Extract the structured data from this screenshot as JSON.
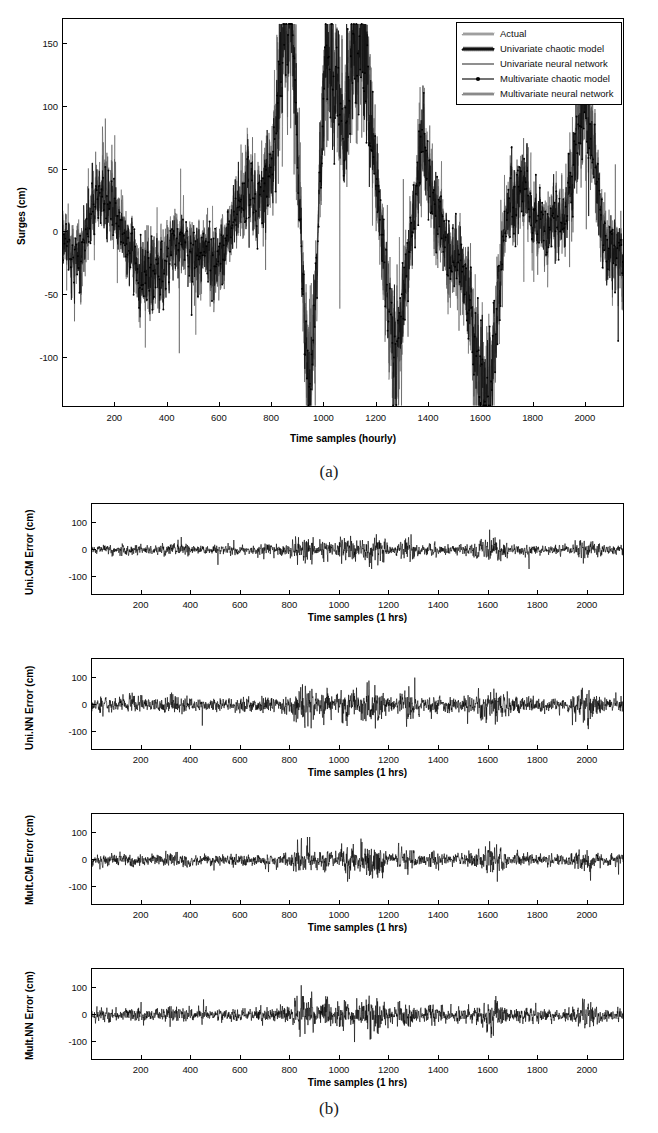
{
  "figure": {
    "caption_a": "(a)",
    "caption_b": "(b)"
  },
  "panel_a": {
    "ylabel": "Surges (cm)",
    "xlabel": "Time samples (hourly)",
    "legend": {
      "items": [
        {
          "label": "Actual",
          "style": "thin-gray",
          "marker": "none",
          "color": "#8f8f8f"
        },
        {
          "label": "Univariate chaotic model",
          "style": "thick-black",
          "marker": "none",
          "color": "#111111"
        },
        {
          "label": "Univariate neural network",
          "style": "thin-black",
          "marker": "none",
          "color": "#333333"
        },
        {
          "label": "Multivariate chaotic model",
          "style": "marker-line",
          "marker": "dot",
          "color": "#000000"
        },
        {
          "label": "Multivariate neural network",
          "style": "thin-gray2",
          "marker": "none",
          "color": "#777777"
        }
      ]
    }
  },
  "panel_b": {
    "subplots": [
      {
        "ylabel": "Uni.CM Error (cm)",
        "xlabel": "Time samples (1 hrs)",
        "noise_amp": 13,
        "seed": 11,
        "spike_scale": 2.9
      },
      {
        "ylabel": "Uni.NN Error (cm)",
        "xlabel": "Time samples (1 hrs)",
        "noise_amp": 19,
        "seed": 23,
        "spike_scale": 3.6
      },
      {
        "ylabel": "Mult.CM Error (cm)",
        "xlabel": "Time samples (1 hrs)",
        "noise_amp": 15,
        "seed": 37,
        "spike_scale": 3.1
      },
      {
        "ylabel": "Mult.NN Error (cm)",
        "xlabel": "Time samples (1 hrs)",
        "noise_amp": 17,
        "seed": 53,
        "spike_scale": 3.8
      }
    ]
  },
  "chart_data": {
    "type": "line",
    "title": "",
    "panels": [
      {
        "id": "a",
        "type": "line",
        "title": "",
        "xlabel": "Time samples (hourly)",
        "ylabel": "Surges (cm)",
        "xlim": [
          0,
          2150
        ],
        "ylim": [
          -140,
          170
        ],
        "xticks": [
          200,
          400,
          600,
          800,
          1000,
          1200,
          1400,
          1600,
          1800,
          2000
        ],
        "yticks": [
          -100,
          -50,
          0,
          50,
          100,
          150
        ],
        "grid": false,
        "legend_position": "top-right",
        "series": [
          {
            "name": "Actual",
            "color": "#8f8f8f",
            "marker": "none",
            "linewidth": 0.7
          },
          {
            "name": "Univariate chaotic model",
            "color": "#111111",
            "marker": "none",
            "linewidth": 1.2
          },
          {
            "name": "Univariate neural network",
            "color": "#333333",
            "marker": "none",
            "linewidth": 0.7
          },
          {
            "name": "Multivariate chaotic model",
            "color": "#000000",
            "marker": "dot",
            "linewidth": 0.8
          },
          {
            "name": "Multivariate neural network",
            "color": "#777777",
            "marker": "none",
            "linewidth": 0.7
          }
        ],
        "envelope_note": "Dense overlapping hourly storm-surge traces; peaks near +160 cm around samples 860 and 1010, deep troughs near -130 cm around samples 950 and 1620.",
        "peaks": [
          {
            "x": 860,
            "y": 158
          },
          {
            "x": 1010,
            "y": 152
          },
          {
            "x": 1130,
            "y": 120
          },
          {
            "x": 1380,
            "y": 95
          },
          {
            "x": 2000,
            "y": 88
          }
        ],
        "troughs": [
          {
            "x": 950,
            "y": -128
          },
          {
            "x": 1620,
            "y": -132
          },
          {
            "x": 1270,
            "y": -92
          },
          {
            "x": 60,
            "y": -55
          }
        ]
      },
      {
        "id": "b1",
        "type": "line",
        "xlabel": "Time samples (1 hrs)",
        "ylabel": "Uni.CM Error (cm)",
        "xlim": [
          0,
          2150
        ],
        "ylim": [
          -170,
          170
        ],
        "xticks": [
          200,
          400,
          600,
          800,
          1000,
          1200,
          1400,
          1600,
          1800,
          2000
        ],
        "yticks": [
          -100,
          0,
          100
        ],
        "grid": false,
        "series": [
          {
            "name": "Uni.CM Error",
            "color": "#000000",
            "linewidth": 0.6
          }
        ],
        "residual_rms": 13,
        "residual_max": 75,
        "residual_min": -70
      },
      {
        "id": "b2",
        "type": "line",
        "xlabel": "Time samples (1 hrs)",
        "ylabel": "Uni.NN Error (cm)",
        "xlim": [
          0,
          2150
        ],
        "ylim": [
          -170,
          170
        ],
        "xticks": [
          200,
          400,
          600,
          800,
          1000,
          1200,
          1400,
          1600,
          1800,
          2000
        ],
        "yticks": [
          -100,
          0,
          100
        ],
        "grid": false,
        "series": [
          {
            "name": "Uni.NN Error",
            "color": "#000000",
            "linewidth": 0.6
          }
        ],
        "residual_rms": 19,
        "residual_max": 105,
        "residual_min": -95
      },
      {
        "id": "b3",
        "type": "line",
        "xlabel": "Time samples (1 hrs)",
        "ylabel": "Mult.CM Error (cm)",
        "xlim": [
          0,
          2150
        ],
        "ylim": [
          -170,
          170
        ],
        "xticks": [
          200,
          400,
          600,
          800,
          1000,
          1200,
          1400,
          1600,
          1800,
          2000
        ],
        "yticks": [
          -100,
          0,
          100
        ],
        "grid": false,
        "series": [
          {
            "name": "Mult.CM Error",
            "color": "#000000",
            "linewidth": 0.6
          }
        ],
        "residual_rms": 15,
        "residual_max": 85,
        "residual_min": -80
      },
      {
        "id": "b4",
        "type": "line",
        "xlabel": "Time samples (1 hrs)",
        "ylabel": "Mult.NN Error (cm)",
        "xlim": [
          0,
          2150
        ],
        "ylim": [
          -170,
          170
        ],
        "xticks": [
          200,
          400,
          600,
          800,
          1000,
          1200,
          1400,
          1600,
          1800,
          2000
        ],
        "yticks": [
          -100,
          0,
          100
        ],
        "grid": false,
        "series": [
          {
            "name": "Mult.NN Error",
            "color": "#000000",
            "linewidth": 0.6
          }
        ],
        "residual_rms": 17,
        "residual_max": 110,
        "residual_min": -100
      }
    ]
  }
}
